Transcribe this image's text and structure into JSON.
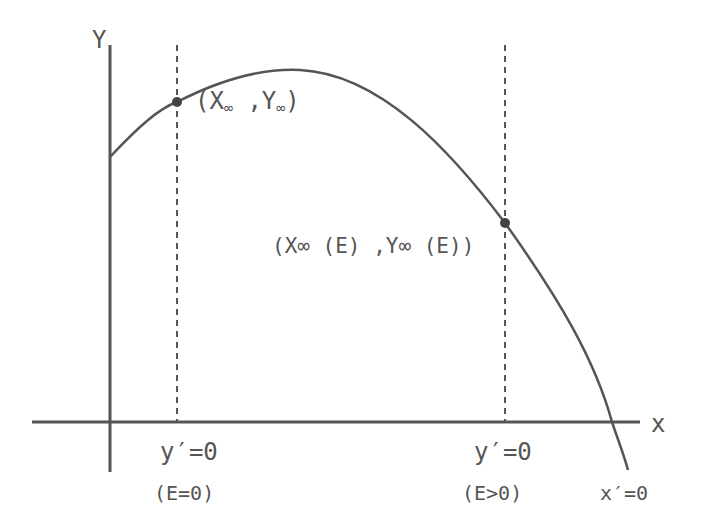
{
  "diagram": {
    "axes": {
      "y_label": "Y",
      "x_label": "x"
    },
    "points": [
      {
        "name": "E=0 point",
        "label_open": "(",
        "label_x": "X",
        "label_x_sub": "∞",
        "label_sep": " ,",
        "label_y": "Y",
        "label_y_sub": "∞",
        "label_close": ")"
      },
      {
        "name": "E>0 point",
        "label": "(X∞ (E) ,Y∞ (E))"
      }
    ],
    "vertical_markers": [
      {
        "condition": "y′=0",
        "note": "(E=0)"
      },
      {
        "condition": "y′=0",
        "note": "(E>0)"
      }
    ],
    "curve_end_label": "x′=0",
    "colors": {
      "line": "#555555",
      "text": "#555555",
      "background": "#ffffff"
    }
  }
}
